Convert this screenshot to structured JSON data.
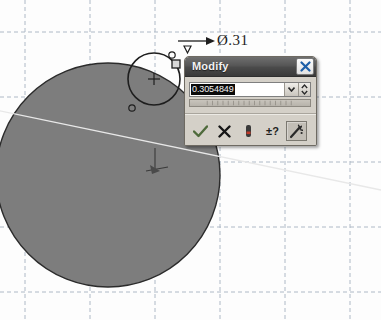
{
  "app": {
    "name": "cad-sketch-view",
    "background_color": "#fdfdfd",
    "grid_color": "#b9c3cf",
    "shape_fill": "#7d7d7d",
    "shape_stroke": "#2f2f2f"
  },
  "sketch": {
    "dimension_label": "Ø.31",
    "dimension_arrow": "arrow-right-icon",
    "origin_marker": "origin-point-icon",
    "large_circle": {
      "name": "large-circle",
      "cx": 108,
      "cy": 175,
      "r": 112,
      "fill": "#7d7d7d"
    },
    "small_circle": {
      "name": "small-circle",
      "cx": 154,
      "cy": 79,
      "r": 26
    },
    "constraint_glyphs": [
      {
        "name": "coincident-constraint-glyph",
        "x": 184,
        "y": 63
      },
      {
        "name": "tangent-constraint-glyph",
        "x": 132,
        "y": 108
      },
      {
        "name": "selected-point-handle",
        "x": 176,
        "y": 64
      }
    ]
  },
  "dialog": {
    "title": "Modify",
    "close_label": "×",
    "close_icon": "close-icon",
    "value": "0.3054849",
    "value_placeholder": "0.000",
    "dropdown_icon": "chevron-down-icon",
    "spinner_icon": "spinner-updown-icon",
    "slider_name": "value-slider",
    "buttons": [
      {
        "id": "accept",
        "name": "accept-button",
        "icon": "checkmark-icon",
        "label": "",
        "pressed": false
      },
      {
        "id": "cancel",
        "name": "cancel-button",
        "icon": "x-mark-icon",
        "label": "",
        "pressed": false
      },
      {
        "id": "measure",
        "name": "measure-button",
        "icon": "measure-icon",
        "label": "",
        "pressed": false
      },
      {
        "id": "tolerance",
        "name": "tolerance-button",
        "icon": "tolerance-icon",
        "label": "±?",
        "pressed": false
      },
      {
        "id": "expression",
        "name": "edit-dimension-button",
        "icon": "magic-wand-icon",
        "label": "",
        "pressed": true
      }
    ]
  }
}
